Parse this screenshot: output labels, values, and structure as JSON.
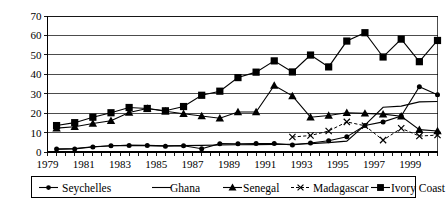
{
  "chart_data": {
    "type": "line",
    "title": "",
    "subtitle": "",
    "xlabel": "",
    "ylabel": "",
    "xlim": [
      1979,
      2000.5
    ],
    "ylim": [
      0,
      70
    ],
    "yticks": [
      0,
      10,
      20,
      30,
      40,
      50,
      60,
      70
    ],
    "ytick_labels": [
      "0",
      "10",
      "20",
      "30",
      "40",
      "50",
      "60",
      "70"
    ],
    "xtick_labels": [
      "1979",
      "1981",
      "1983",
      "1985",
      "1987",
      "1989",
      "1991",
      "1993",
      "1995",
      "1997",
      "1999"
    ],
    "xtick_label_values": [
      1979,
      1981,
      1983,
      1985,
      1987,
      1989,
      1991,
      1993,
      1995,
      1997,
      1999
    ],
    "xtick_minor_values": [
      1979,
      1979.5,
      1980,
      1980.5,
      1981,
      1981.5,
      1982,
      1982.5,
      1983,
      1983.5,
      1984,
      1984.5,
      1985,
      1985.5,
      1986,
      1986.5,
      1987,
      1987.5,
      1988,
      1988.5,
      1989,
      1989.5,
      1990,
      1990.5,
      1991,
      1991.5,
      1992,
      1992.5,
      1993,
      1993.5,
      1994,
      1994.5,
      1995,
      1995.5,
      1996,
      1996.5,
      1997,
      1997.5,
      1998,
      1998.5,
      1999,
      1999.5,
      2000,
      2000.5
    ],
    "grid": true,
    "grid_axis": "y",
    "legend_position": "bottom",
    "x": [
      1979.5,
      1980.5,
      1981.5,
      1982.5,
      1983.5,
      1984.5,
      1985.5,
      1986.5,
      1987.5,
      1988.5,
      1989.5,
      1990.5,
      1991.5,
      1992.5,
      1993.5,
      1994.5,
      1995.5,
      1996.5,
      1997.5,
      1998.5,
      1999.5,
      2000.5
    ],
    "series": [
      {
        "name": "Seychelles",
        "marker": "circle",
        "linestyle": "solid",
        "color": "#000000",
        "values": [
          1.5,
          1.6,
          2.6,
          3.2,
          3.4,
          3.3,
          3.0,
          3.2,
          1.7,
          4.3,
          4.2,
          4.4,
          4.4,
          3.6,
          4.6,
          5.8,
          7.8,
          13.6,
          15.5,
          18.5,
          33.6,
          29.5
        ]
      },
      {
        "name": "Ghana",
        "marker": "none",
        "linestyle": "solid",
        "color": "#000000",
        "values": [
          1.5,
          1.8,
          2.7,
          3.2,
          3.5,
          3.4,
          3.2,
          3.3,
          3.4,
          3.6,
          3.7,
          3.8,
          3.9,
          4.0,
          4.3,
          4.8,
          5.6,
          13.8,
          23.0,
          23.6,
          25.8,
          26.0
        ]
      },
      {
        "name": "Senegal",
        "marker": "triangle",
        "linestyle": "solid",
        "color": "#000000",
        "values": [
          12.3,
          13.0,
          14.7,
          16.1,
          20.3,
          22.4,
          21.0,
          19.7,
          18.5,
          17.4,
          20.6,
          20.6,
          34.2,
          28.9,
          17.9,
          18.8,
          20.2,
          19.9,
          19.5,
          18.4,
          11.5,
          10.8
        ]
      },
      {
        "name": "Madagascar",
        "marker": "x",
        "linestyle": "dashed",
        "color": "#000000",
        "values": [
          null,
          null,
          null,
          null,
          null,
          null,
          null,
          null,
          null,
          null,
          null,
          null,
          null,
          7.7,
          8.5,
          10.8,
          15.5,
          13.5,
          6.1,
          12.2,
          8.2,
          8.7
        ]
      },
      {
        "name": "Ivory Coast",
        "marker": "square",
        "linestyle": "solid",
        "color": "#000000",
        "values": [
          13.6,
          15.1,
          17.9,
          20.2,
          22.9,
          22.4,
          21.2,
          23.4,
          29.2,
          31.3,
          38.3,
          41.1,
          46.9,
          41.2,
          49.9,
          43.8,
          57.1,
          61.4,
          48.9,
          58.1,
          46.5,
          57.4
        ]
      }
    ]
  },
  "legend": {
    "entries": [
      {
        "label": "Seychelles",
        "marker": "circle",
        "linestyle": "solid"
      },
      {
        "label": "Ghana",
        "marker": "none",
        "linestyle": "solid"
      },
      {
        "label": "Senegal",
        "marker": "triangle",
        "linestyle": "solid"
      },
      {
        "label": "Madagascar",
        "marker": "x",
        "linestyle": "dashed"
      },
      {
        "label": "Ivory Coast",
        "marker": "square",
        "linestyle": "solid"
      }
    ]
  }
}
